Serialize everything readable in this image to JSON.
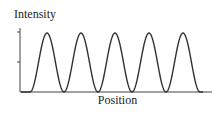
{
  "chart_data": {
    "type": "line",
    "title": "",
    "xlabel": "Position",
    "ylabel": "Intensity",
    "x": [
      0,
      0.5,
      1,
      1.5,
      2,
      2.5,
      3,
      3.5,
      4,
      4.5,
      5,
      5.5
    ],
    "values": [
      0,
      1,
      0,
      1,
      0,
      1,
      0,
      1,
      0,
      1,
      0,
      0
    ],
    "peaks": 5,
    "ylim": [
      0,
      1
    ],
    "yticks": [
      0.5,
      1
    ],
    "ytick_labels": [
      "",
      ""
    ],
    "xticks": [],
    "grid": false,
    "legend": null,
    "line_color": "#333333"
  }
}
